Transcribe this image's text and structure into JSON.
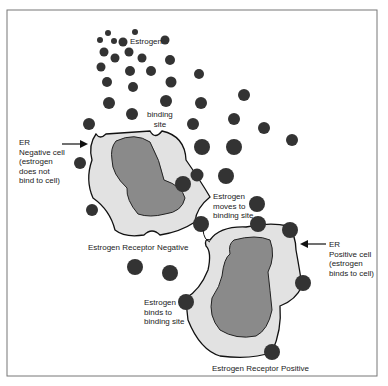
{
  "diagram": {
    "labels": {
      "estrogen": "Estrogen",
      "binding_site": "binding\nsite",
      "er_negative_cell": "ER\nNegative cell\n(estrogen\ndoes not\nbind to cell)",
      "estrogen_moves": "Estrogen\nmoves to\nbinding site",
      "er_negative_caption": "Estrogen Receptor Negative",
      "er_positive_cell": "ER\nPositive cell\n(estrogen\nbinds to cell)",
      "estrogen_binds": "Estrogen\nbinds to\nbinding site",
      "er_positive_caption": "Estrogen Receptor Positive"
    },
    "colors": {
      "molecule": "#333333",
      "cytoplasm": "#e2e2e2",
      "nucleus": "#8a8a8a",
      "outline": "#111111",
      "frame": "#777777"
    }
  }
}
